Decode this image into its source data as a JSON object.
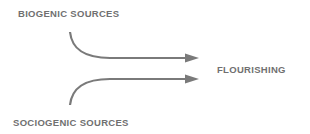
{
  "diagram": {
    "inputs": [
      {
        "label": "BIOGENIC SOURCES"
      },
      {
        "label": "SOCIOGENIC SOURCES"
      }
    ],
    "output": {
      "label": "FLOURISHING"
    },
    "colors": {
      "line": "#7a7a7a",
      "text": "#707070"
    }
  }
}
